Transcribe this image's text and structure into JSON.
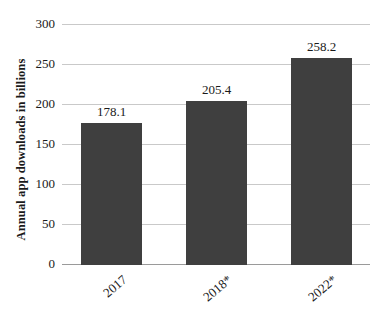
{
  "chart_data": {
    "type": "bar",
    "title": "",
    "subtitle": "",
    "xlabel": "",
    "ylabel": "Annual app downloads in billions",
    "categories": [
      "2017",
      "2018*",
      "2022*"
    ],
    "values": [
      178.1,
      205.4,
      258.2
    ],
    "value_labels": [
      "178.1",
      "205.4",
      "258.2"
    ],
    "series": [
      {
        "name": "Annual app downloads",
        "values": [
          178.1,
          205.4,
          258.2
        ]
      }
    ],
    "ylim": [
      0,
      300
    ],
    "y_ticks": [
      0,
      50,
      100,
      150,
      200,
      250,
      300
    ],
    "y_tick_labels": [
      "0",
      "50",
      "100",
      "150",
      "200",
      "250",
      "300"
    ],
    "grid": true,
    "grid_axis": "y",
    "legend": false,
    "legend_position": "none",
    "bar_color": "#3f3f3f",
    "gridline_color": "#c9c9c9",
    "baseline_color": "#9a9a9a",
    "text_color": "#1a1a1a",
    "background_color": "#ffffff",
    "x_tick_rotation": -40,
    "annotations": []
  }
}
